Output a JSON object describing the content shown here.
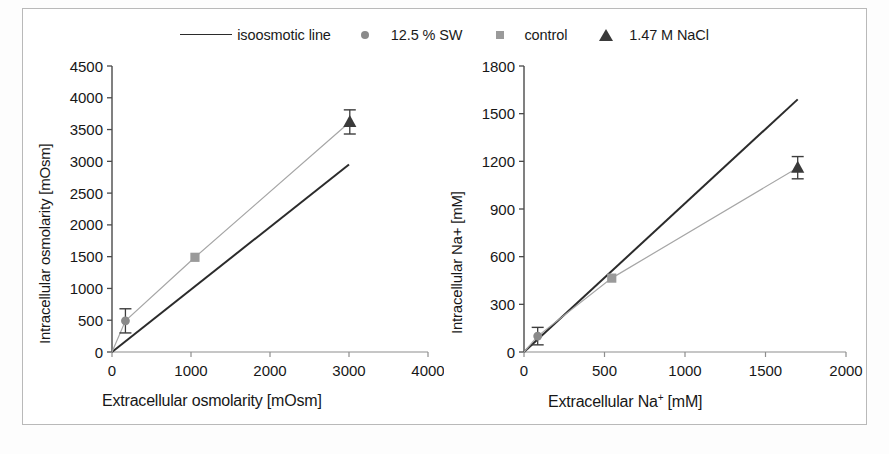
{
  "figure": {
    "background": "#ffffff",
    "border_color": "#b9b9b9"
  },
  "legend": {
    "position": "top-center",
    "entries": [
      {
        "label": "isoosmotic line",
        "marker": "line",
        "color": "#2b2b2b"
      },
      {
        "label": "12.5 % SW",
        "marker": "circle",
        "color": "#8a8a8a"
      },
      {
        "label": "control",
        "marker": "square",
        "color": "#9a9a9a"
      },
      {
        "label": "1.47 M NaCl",
        "marker": "triangle",
        "color": "#3a3a3a"
      }
    ]
  },
  "chart_data": [
    {
      "type": "scatter",
      "id": "osmolarity",
      "title": "",
      "xlabel": "Extracellular osmolarity [mOsm]",
      "ylabel": "Intracellular osmolarity [mOsm]",
      "xlim": [
        0,
        4000
      ],
      "ylim": [
        0,
        4500
      ],
      "xticks": [
        0,
        1000,
        2000,
        3000,
        4000
      ],
      "yticks": [
        0,
        500,
        1000,
        1500,
        2000,
        2500,
        3000,
        3500,
        4000,
        4500
      ],
      "xticklabels": [
        "0",
        "1000",
        "2000",
        "3000",
        "4000"
      ],
      "yticklabels": [
        "0",
        "500",
        "1000",
        "1500",
        "2000",
        "2500",
        "3000",
        "3500",
        "4000",
        "4500"
      ],
      "grid": false,
      "legend_position": "figure-top",
      "series": [
        {
          "name": "isoosmotic line",
          "type": "line",
          "color": "#2b2b2b",
          "x": [
            0,
            3000
          ],
          "y": [
            0,
            2950
          ]
        },
        {
          "name": "measured trend",
          "type": "line",
          "color": "#a6a6a6",
          "x": [
            0,
            170,
            1050,
            3010
          ],
          "y": [
            0,
            490,
            1490,
            3620
          ]
        },
        {
          "name": "12.5 % SW",
          "type": "point",
          "marker": "circle",
          "color": "#8a8a8a",
          "x": [
            170
          ],
          "y": [
            490
          ],
          "yerr": [
            190
          ]
        },
        {
          "name": "control",
          "type": "point",
          "marker": "square",
          "color": "#9a9a9a",
          "x": [
            1050
          ],
          "y": [
            1490
          ],
          "yerr": [
            0
          ]
        },
        {
          "name": "1.47 M NaCl",
          "type": "point",
          "marker": "triangle",
          "color": "#3a3a3a",
          "x": [
            3010
          ],
          "y": [
            3620
          ],
          "yerr": [
            190
          ]
        }
      ]
    },
    {
      "type": "scatter",
      "id": "sodium",
      "title": "",
      "xlabel_parts": {
        "pre": "Extracellular Na",
        "sup": "+",
        "post": " [mM]"
      },
      "xlabel": "Extracellular Na+ [mM]",
      "ylabel": "Intracellular Na+ [mM]",
      "xlim": [
        0,
        2000
      ],
      "ylim": [
        0,
        1800
      ],
      "xticks": [
        0,
        500,
        1000,
        1500,
        2000
      ],
      "yticks": [
        0,
        300,
        600,
        900,
        1200,
        1500,
        1800
      ],
      "xticklabels": [
        "0",
        "500",
        "1000",
        "1500",
        "2000"
      ],
      "yticklabels": [
        "0",
        "300",
        "600",
        "900",
        "1200",
        "1500",
        "1800"
      ],
      "grid": false,
      "legend_position": "figure-top",
      "series": [
        {
          "name": "isoosmotic line",
          "type": "line",
          "color": "#2b2b2b",
          "x": [
            0,
            1700
          ],
          "y": [
            0,
            1590
          ]
        },
        {
          "name": "measured trend",
          "type": "line",
          "color": "#a6a6a6",
          "x": [
            0,
            85,
            545,
            1700
          ],
          "y": [
            0,
            100,
            465,
            1160
          ]
        },
        {
          "name": "12.5 % SW",
          "type": "point",
          "marker": "circle",
          "color": "#8a8a8a",
          "x": [
            85
          ],
          "y": [
            100
          ],
          "yerr": [
            55
          ]
        },
        {
          "name": "control",
          "type": "point",
          "marker": "square",
          "color": "#9a9a9a",
          "x": [
            545
          ],
          "y": [
            465
          ],
          "yerr": [
            0
          ]
        },
        {
          "name": "1.47 M NaCl",
          "type": "point",
          "marker": "triangle",
          "color": "#3a3a3a",
          "x": [
            1700
          ],
          "y": [
            1160
          ],
          "yerr": [
            70
          ]
        }
      ]
    }
  ]
}
